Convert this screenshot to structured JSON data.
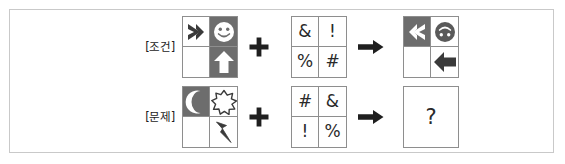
{
  "frame": {
    "border_color": "#c9c9c9",
    "background": "#ffffff"
  },
  "colors": {
    "dark_cell": "#6d6d6d",
    "light_cell": "#ffffff",
    "grid_line": "#8e8e8e",
    "glyph_dark": "#2a2a2a",
    "glyph_light": "#ffffff"
  },
  "rows": [
    {
      "id": "condition",
      "label": "[조건]",
      "operator_plus": "+",
      "operator_arrow": "→",
      "input_grid": {
        "name": "condition-input-grid",
        "cells": [
          {
            "position": "top-left",
            "fill": "light",
            "icon": "chevron-right-icon",
            "icon_color": "dark"
          },
          {
            "position": "top-right",
            "fill": "dark",
            "icon": "smiley-face-icon",
            "icon_color": "light"
          },
          {
            "position": "bottom-left",
            "fill": "light",
            "icon": "empty",
            "icon_color": "none"
          },
          {
            "position": "bottom-right",
            "fill": "dark",
            "icon": "arrow-up-icon",
            "icon_color": "light"
          }
        ]
      },
      "rule_grid": {
        "name": "condition-rule-grid",
        "cells": [
          {
            "position": "top-left",
            "symbol": "&"
          },
          {
            "position": "top-right",
            "symbol": "!"
          },
          {
            "position": "bottom-left",
            "symbol": "%"
          },
          {
            "position": "bottom-right",
            "symbol": "#"
          }
        ]
      },
      "result": {
        "type": "grid",
        "name": "condition-result-grid",
        "cells": [
          {
            "position": "top-left",
            "fill": "dark",
            "icon": "chevron-left-icon",
            "icon_color": "light"
          },
          {
            "position": "top-right",
            "fill": "light",
            "icon": "smiley-face-inverted-icon",
            "icon_color": "dark"
          },
          {
            "position": "bottom-left",
            "fill": "light",
            "icon": "empty",
            "icon_color": "none"
          },
          {
            "position": "bottom-right",
            "fill": "light",
            "icon": "arrow-left-icon",
            "icon_color": "dark"
          }
        ]
      }
    },
    {
      "id": "question",
      "label": "[문제]",
      "operator_plus": "+",
      "operator_arrow": "→",
      "input_grid": {
        "name": "question-input-grid",
        "cells": [
          {
            "position": "top-left",
            "fill": "dark",
            "icon": "crescent-moon-icon",
            "icon_color": "light"
          },
          {
            "position": "top-right",
            "fill": "light",
            "icon": "starburst-icon",
            "icon_color": "dark"
          },
          {
            "position": "bottom-left",
            "fill": "light",
            "icon": "empty",
            "icon_color": "none"
          },
          {
            "position": "bottom-right",
            "fill": "light",
            "icon": "lightning-bolt-icon",
            "icon_color": "dark"
          }
        ]
      },
      "rule_grid": {
        "name": "question-rule-grid",
        "cells": [
          {
            "position": "top-left",
            "symbol": "#"
          },
          {
            "position": "top-right",
            "symbol": "&"
          },
          {
            "position": "bottom-left",
            "symbol": "!"
          },
          {
            "position": "bottom-right",
            "symbol": "%"
          }
        ]
      },
      "result": {
        "type": "single",
        "name": "question-result-box",
        "symbol": "?"
      }
    }
  ]
}
